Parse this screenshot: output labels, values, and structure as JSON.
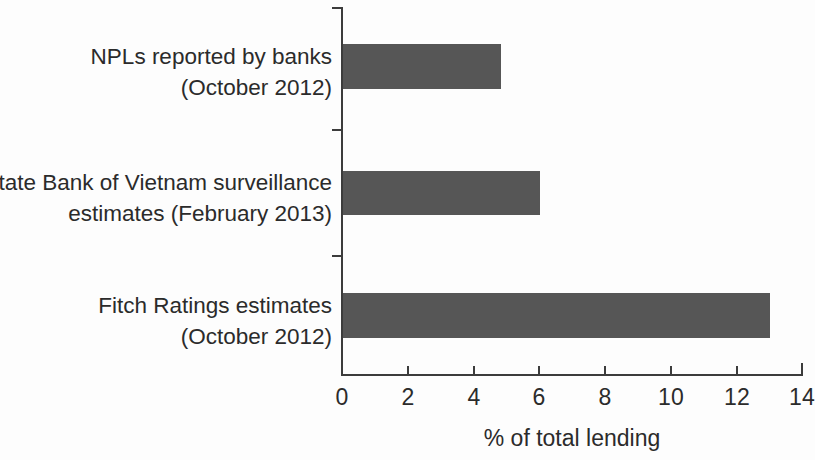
{
  "chart_data": {
    "type": "bar",
    "orientation": "horizontal",
    "title": "",
    "subtitle": "",
    "xlabel": "% of total lending",
    "ylabel": "",
    "categories": [
      "NPLs reported by banks\n(October 2012)",
      "State Bank of Vietnam surveillance\nestimates (February 2013)",
      "Fitch Ratings estimates\n(October 2012)"
    ],
    "values": [
      4.8,
      6.0,
      13.0
    ],
    "series": [
      {
        "name": "% of total lending",
        "values": [
          4.8,
          6.0,
          13.0
        ]
      }
    ],
    "xlim": [
      0,
      14
    ],
    "xticks": [
      0,
      2,
      4,
      6,
      8,
      10,
      12,
      14
    ],
    "xtick_labels": [
      "0",
      "2",
      "4",
      "6",
      "8",
      "10",
      "12",
      "14"
    ],
    "grid": false,
    "legend": false,
    "legend_position": "none",
    "bar_color": "#565656",
    "axis_color": "#3c3c3c",
    "text_color": "#2b2b2b",
    "background_color": "#ffffff",
    "annotations": []
  },
  "figure": {
    "bars": [
      {
        "label_line1": "NPLs reported by banks",
        "label_line2": "(October 2012)",
        "value": 4.8
      },
      {
        "label_line1": "State Bank of Vietnam surveillance",
        "label_line2": "estimates (February 2013)",
        "value": 6.0
      },
      {
        "label_line1": "Fitch Ratings estimates",
        "label_line2": "(October 2012)",
        "value": 13.0
      }
    ]
  }
}
